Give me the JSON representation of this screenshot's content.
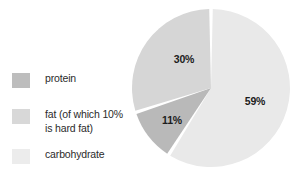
{
  "chart_data": {
    "type": "pie",
    "title": "",
    "categories": [
      "carbohydrate",
      "fat (of which 10% is hard fat)",
      "protein"
    ],
    "values": [
      59,
      11,
      30
    ],
    "slices": [
      {
        "name": "carbohydrate",
        "value": 59,
        "label": "59%",
        "color": "#e9e9e9",
        "start_angle": 0,
        "end_angle": 212.4
      },
      {
        "name": "protein",
        "value": 11,
        "label": "11%",
        "color": "#b9b9b9",
        "start_angle": 212.4,
        "end_angle": 252.0
      },
      {
        "name": "fat",
        "value": 30,
        "label": "30%",
        "color": "#d6d6d6",
        "start_angle": 252.0,
        "end_angle": 360
      }
    ],
    "units": "%",
    "legend_position": "left",
    "grid": false,
    "separator_color": "#ffffff",
    "background": "#ffffff"
  },
  "legend": {
    "items": [
      {
        "label": "protein",
        "color": "#bdbdbd"
      },
      {
        "label": "fat (of which 10%\nis hard fat)",
        "color": "#d8d8d8"
      },
      {
        "label": "carbohydrate",
        "color": "#ececec"
      }
    ]
  },
  "labels": {
    "carbohydrate_pct": "59%",
    "fat_pct": "30%",
    "protein_pct": "11%"
  }
}
